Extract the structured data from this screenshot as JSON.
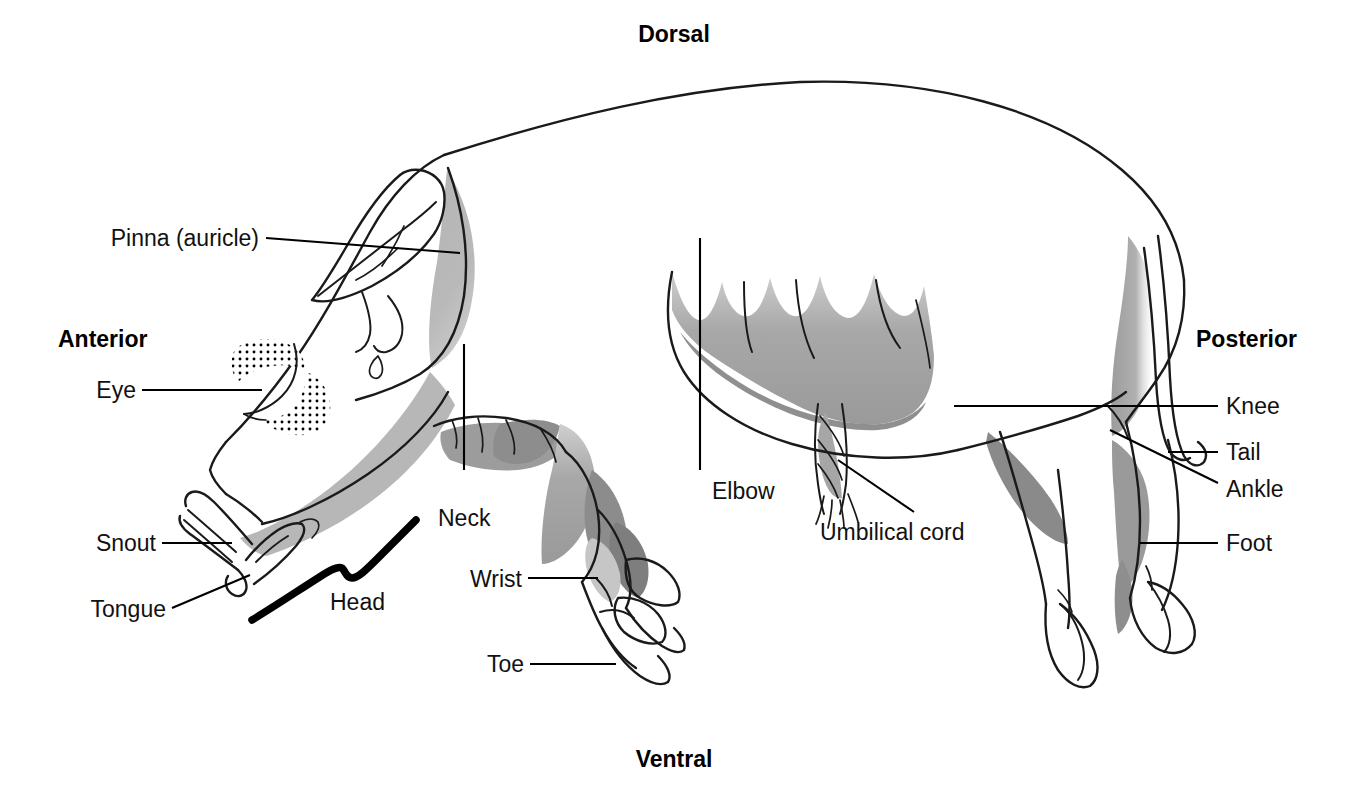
{
  "figure": {
    "orientation_labels": {
      "dorsal": "Dorsal",
      "ventral": "Ventral",
      "anterior": "Anterior",
      "posterior": "Posterior"
    }
  },
  "labels": {
    "pinna": "Pinna (auricle)",
    "eye": "Eye",
    "snout": "Snout",
    "tongue": "Tongue",
    "head": "Head",
    "neck": "Neck",
    "wrist": "Wrist",
    "toe": "Toe",
    "elbow": "Elbow",
    "umbilical_cord": "Umbilical cord",
    "knee": "Knee",
    "tail": "Tail",
    "ankle": "Ankle",
    "foot": "Foot"
  },
  "colors": {
    "ink": "#1a1a1a",
    "leader": "#000000",
    "shade_light": "#b9b9b9",
    "shade_mid": "#a3a3a3",
    "shade_dark": "#8a8a8a",
    "background": "#ffffff"
  }
}
